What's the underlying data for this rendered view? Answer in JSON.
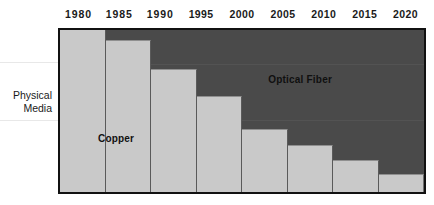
{
  "chart_data": {
    "type": "bar",
    "title": "",
    "subtitle": "",
    "xlabel": "",
    "ylabel": "Physical\nMedia",
    "categories": [
      "1980",
      "1985",
      "1990",
      "1995",
      "2000",
      "2005",
      "2010",
      "2015",
      "2020"
    ],
    "tick_labels": [
      "1980",
      "1985",
      "1990",
      "1995",
      "2000",
      "2005",
      "2010",
      "2015",
      "2020"
    ],
    "ylim": [
      0,
      100
    ],
    "grid": false,
    "legend_position": "inline-annotation",
    "stacked": true,
    "series": [
      {
        "name": "Copper",
        "color": "#c9c9c9",
        "values": [
          100,
          94,
          76,
          59,
          39,
          29,
          20,
          11,
          0
        ]
      },
      {
        "name": "Optical Fiber",
        "color": "#4a4a4a",
        "values": [
          0,
          6,
          24,
          41,
          61,
          71,
          80,
          89,
          100
        ]
      }
    ],
    "annotations": [
      {
        "text": "Copper",
        "series": "Copper"
      },
      {
        "text": "Optical Fiber",
        "series": "Optical Fiber"
      }
    ],
    "segments": [
      {
        "span": "1980-1985",
        "copper_pct": 100
      },
      {
        "span": "1985-1990",
        "copper_pct": 94
      },
      {
        "span": "1990-1995",
        "copper_pct": 76
      },
      {
        "span": "1995-2000",
        "copper_pct": 59
      },
      {
        "span": "2000-2005",
        "copper_pct": 39
      },
      {
        "span": "2005-2010",
        "copper_pct": 29
      },
      {
        "span": "2010-2015",
        "copper_pct": 20
      },
      {
        "span": "2015-2020",
        "copper_pct": 11
      }
    ]
  },
  "colors": {
    "copper": "#c9c9c9",
    "fiber": "#4a4a4a",
    "frame": "#111111",
    "text": "#1a1a1a",
    "background": "#ffffff"
  },
  "axis": {
    "ticks": [
      {
        "label": "1980"
      },
      {
        "label": "1985"
      },
      {
        "label": "1990"
      },
      {
        "label": "1995"
      },
      {
        "label": "2000"
      },
      {
        "label": "2005"
      },
      {
        "label": "2010"
      },
      {
        "label": "2015"
      },
      {
        "label": "2020"
      }
    ]
  },
  "labels": {
    "y_category": "Physical\nMedia",
    "copper": "Copper",
    "optical_fiber": "Optical Fiber"
  }
}
